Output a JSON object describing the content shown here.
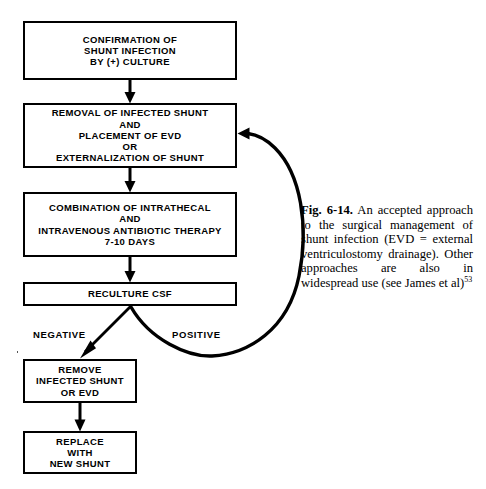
{
  "figure": {
    "label": "Fig. 6-14.",
    "caption_text": " An accepted approach to the surgical management of shunt infection (EVD = external ventriculostomy drainage). Other approaches are also in widespread use (see James et al)",
    "reference_superscript": "53"
  },
  "flowchart": {
    "type": "flowchart",
    "title": "An accepted approach to the surgical management of shunt infection",
    "ink_color": "#000000",
    "background_color": "#ffffff",
    "nodes": [
      {
        "id": "confirmation",
        "text": "CONFIRMATION OF\nSHUNT INFECTION\nBY (+) CULTURE",
        "x": 23,
        "y": 21,
        "width": 214,
        "height": 59
      },
      {
        "id": "removal",
        "text": "REMOVAL OF INFECTED SHUNT\nAND\nPLACEMENT OF EVD\nOR\nEXTERNALIZATION OF SHUNT",
        "x": 23,
        "y": 103,
        "width": 214,
        "height": 65
      },
      {
        "id": "antibiotics",
        "text": "COMBINATION OF INTRATHECAL\nAND\nINTRAVENOUS ANTIBIOTIC THERAPY\n7-10 DAYS",
        "x": 23,
        "y": 192,
        "width": 214,
        "height": 65
      },
      {
        "id": "reculture",
        "text": "RECULTURE CSF",
        "x": 23,
        "y": 282,
        "width": 214,
        "height": 24
      },
      {
        "id": "remove",
        "text": "REMOVE\nINFECTED SHUNT\nOR EVD",
        "x": 23,
        "y": 359,
        "width": 114,
        "height": 44
      },
      {
        "id": "replace",
        "text": "REPLACE\nWITH\nNEW SHUNT",
        "x": 23,
        "y": 431,
        "width": 114,
        "height": 43
      }
    ],
    "branch_labels": [
      {
        "id": "negative",
        "text": "NEGATIVE",
        "x": 33,
        "y": 329
      },
      {
        "id": "positive",
        "text": "POSITIVE",
        "x": 172,
        "y": 329
      }
    ],
    "edges": [
      {
        "id": "confirmation-to-removal",
        "from": "confirmation",
        "to": "removal",
        "style": "straight-arrow-down"
      },
      {
        "id": "removal-to-antibiotics",
        "from": "removal",
        "to": "antibiotics",
        "style": "straight-arrow-down"
      },
      {
        "id": "antibiotics-to-reculture",
        "from": "antibiotics",
        "to": "reculture",
        "style": "straight-arrow-down"
      },
      {
        "id": "reculture-negative-to-remove",
        "from": "reculture",
        "to": "remove",
        "label": "NEGATIVE",
        "style": "diagonal-arrow-down-left"
      },
      {
        "id": "reculture-positive-to-removal",
        "from": "reculture",
        "to": "removal",
        "label": "POSITIVE",
        "style": "curved-loop-arrow-up-left"
      },
      {
        "id": "remove-to-replace",
        "from": "remove",
        "to": "replace",
        "style": "straight-arrow-down"
      }
    ]
  }
}
